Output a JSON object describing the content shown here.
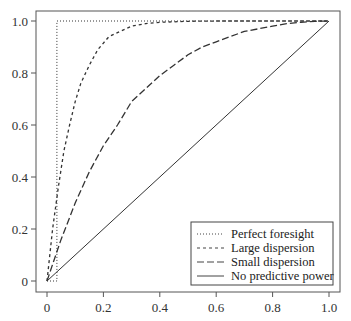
{
  "chart_data": {
    "type": "line",
    "title": "",
    "xlabel": "",
    "ylabel": "",
    "xlim": [
      0,
      1
    ],
    "ylim": [
      0,
      1
    ],
    "grid": false,
    "legend_position": "lower right",
    "x_ticks": [
      0,
      0.2,
      0.4,
      0.6,
      0.8,
      1.0
    ],
    "x_tick_labels": [
      "0",
      "0.2",
      "0.4",
      "0.6",
      "0.8",
      "1.0"
    ],
    "y_ticks": [
      0,
      0.2,
      0.4,
      0.6,
      0.8,
      1.0
    ],
    "y_tick_labels": [
      "0",
      "0.2",
      "0.4",
      "0.6",
      "0.8",
      "1.0"
    ],
    "series": [
      {
        "name": "Perfect foresight",
        "style": "dotted",
        "x": [
          0,
          0.035,
          0.035,
          1.0
        ],
        "y": [
          0,
          0.0,
          1.0,
          1.0
        ]
      },
      {
        "name": "Large dispersion",
        "style": "short-dashed",
        "x": [
          0,
          0.02,
          0.04,
          0.06,
          0.08,
          0.1,
          0.12,
          0.15,
          0.18,
          0.22,
          0.26,
          0.3,
          0.35,
          0.4,
          0.5,
          0.6,
          0.7,
          0.8,
          0.9,
          1.0
        ],
        "y": [
          0,
          0.2,
          0.36,
          0.5,
          0.6,
          0.69,
          0.76,
          0.83,
          0.89,
          0.94,
          0.96,
          0.98,
          0.99,
          0.995,
          0.999,
          1.0,
          1.0,
          1.0,
          1.0,
          1.0
        ]
      },
      {
        "name": "Small dispersion",
        "style": "long-dashed",
        "x": [
          0,
          0.025,
          0.05,
          0.075,
          0.1,
          0.15,
          0.2,
          0.25,
          0.3,
          0.35,
          0.4,
          0.45,
          0.5,
          0.55,
          0.6,
          0.65,
          0.7,
          0.75,
          0.8,
          0.85,
          0.9,
          0.95,
          1.0
        ],
        "y": [
          0,
          0.08,
          0.16,
          0.23,
          0.3,
          0.42,
          0.52,
          0.6,
          0.69,
          0.74,
          0.79,
          0.83,
          0.87,
          0.9,
          0.92,
          0.94,
          0.96,
          0.97,
          0.98,
          0.99,
          0.995,
          0.999,
          1.0
        ]
      },
      {
        "name": "No predictive power",
        "style": "solid",
        "x": [
          0,
          1.0
        ],
        "y": [
          0,
          1.0
        ]
      }
    ]
  },
  "legend": {
    "items": [
      {
        "label": "Perfect foresight"
      },
      {
        "label": "Large dispersion"
      },
      {
        "label": "Small dispersion"
      },
      {
        "label": "No predictive power"
      }
    ]
  }
}
